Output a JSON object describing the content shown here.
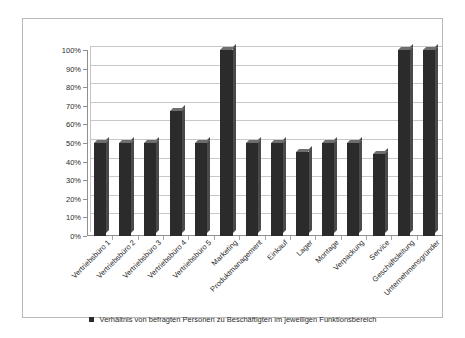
{
  "chart_data": {
    "type": "bar",
    "title": "",
    "subtitle": "",
    "xlabel": "",
    "ylabel": "",
    "ylim": [
      0,
      100
    ],
    "grid": true,
    "legend_position": "bottom",
    "categories": [
      "Vertriebsbüro 1",
      "Vertriebsbüro 2",
      "Vertriebsbüro 3",
      "Vertriebsbüro 4",
      "Vertriebsbüro 5",
      "Marketing",
      "Produktmanagement",
      "Einkauf",
      "Lager",
      "Montage",
      "Verpackung",
      "Service",
      "Geschäftsleitung",
      "Unternehmensgründer"
    ],
    "values": [
      50,
      50,
      50,
      67,
      50,
      100,
      50,
      50,
      45,
      50,
      50,
      44,
      100,
      100
    ],
    "ytick_labels": [
      "100%",
      "90%",
      "80%",
      "70%",
      "60%",
      "50%",
      "40%",
      "30%",
      "20%",
      "10%",
      "0%"
    ],
    "ytick_values": [
      100,
      90,
      80,
      70,
      60,
      50,
      40,
      30,
      20,
      10,
      0
    ],
    "series": [
      {
        "name": "Verhältnis von befragten Personen zu Beschäftigten im jeweiligen Funktionsbereich",
        "values": [
          50,
          50,
          50,
          67,
          50,
          100,
          50,
          50,
          45,
          50,
          50,
          44,
          100,
          100
        ],
        "color": "#2b2b2b"
      }
    ]
  },
  "legend": {
    "marker_icon": "square-marker-icon",
    "label": "Verhältnis von befragten Personen zu Beschäftigten im jeweiligen Funktionsbereich"
  },
  "colors": {
    "bar": "#2b2b2b",
    "bar_side": "#4a4a4a",
    "bar_top": "#6e6e6e",
    "grid": "#c8c8c8",
    "axis": "#8f8f8f",
    "frame": "#b9b9b9",
    "text": "#2b2b2b",
    "background": "#ffffff"
  }
}
